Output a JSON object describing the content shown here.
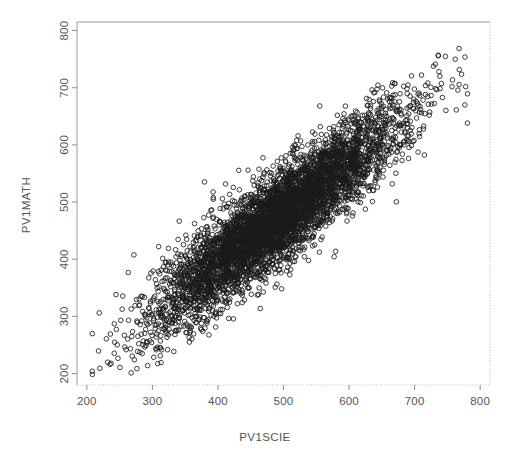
{
  "figure": {
    "background_color": "#ffffff",
    "plot_area": {
      "left": 77,
      "top": 22,
      "right": 490,
      "bottom": 385
    },
    "point_color": "#1a1a1a",
    "axis_color": "#999999",
    "text_color": "#555555"
  },
  "chart_data": {
    "type": "scatter",
    "title": "",
    "subtitle": "",
    "xlabel": "PV1SCIE",
    "ylabel": "PV1MATH",
    "xlim": [
      185,
      815
    ],
    "ylim": [
      180,
      815
    ],
    "xticks": [
      200,
      300,
      400,
      500,
      600,
      700,
      800
    ],
    "yticks": [
      200,
      300,
      400,
      500,
      600,
      700,
      800
    ],
    "xtick_labels": [
      "200",
      "300",
      "400",
      "500",
      "600",
      "700",
      "800"
    ],
    "ytick_labels": [
      "200",
      "300",
      "400",
      "500",
      "600",
      "700",
      "800"
    ],
    "grid": false,
    "legend": null,
    "legend_position": "none",
    "annotations": [],
    "marker": "open-circle",
    "marker_size": 4.6,
    "n_points": 5200,
    "series": [
      {
        "name": "students",
        "distribution": "bivariate-normal",
        "x_mean": 490,
        "y_mean": 472,
        "x_sd": 93,
        "y_sd": 92,
        "correlation": 0.9,
        "x_range": [
          200,
          790
        ],
        "y_range": [
          195,
          790
        ]
      }
    ]
  }
}
